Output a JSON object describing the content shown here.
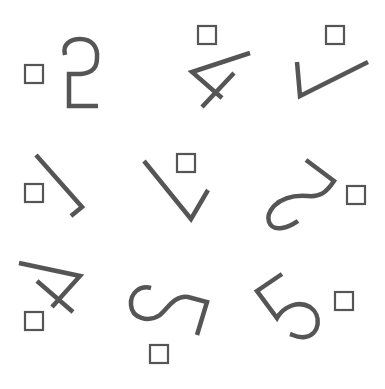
{
  "canvas": {
    "width": 385,
    "height": 389,
    "background": "#ffffff"
  },
  "colors": {
    "stroke": "#555555",
    "box": "#555555"
  },
  "glyphs": [
    {
      "id": "glyph-1",
      "label": "mirrored-2",
      "box": {
        "x": 25,
        "y": 65,
        "size": 18
      },
      "path": "M65 55 C62 43 72 39 80 39 C92 39 98 47 97 58 C97 70 90 75 72 74 L69 74 L69 106 L98 106"
    },
    {
      "id": "glyph-2",
      "label": "rotated-4",
      "box": {
        "x": 198,
        "y": 26,
        "size": 18
      },
      "path": "M250 53 L192 72 L222 98 M234 73 L202 107"
    },
    {
      "id": "glyph-3",
      "label": "rotated-check",
      "box": {
        "x": 326,
        "y": 26,
        "size": 18
      },
      "path": "M297 62 L300 96 L368 62"
    },
    {
      "id": "glyph-4",
      "label": "rotated-1",
      "box": {
        "x": 25,
        "y": 184,
        "size": 18
      },
      "path": "M36 155 L82 207 L71 216"
    },
    {
      "id": "glyph-5",
      "label": "rotated-check",
      "box": {
        "x": 177,
        "y": 154,
        "size": 18
      },
      "path": "M144 161 L191 219 L208 190"
    },
    {
      "id": "glyph-6",
      "label": "rotated-2",
      "box": {
        "x": 347,
        "y": 186,
        "size": 18
      },
      "path": "M306 160 L334 181 C326 193 320 197 308 196 C295 195 282 198 274 206 C264 217 268 230 282 228 C290 227 295 223 298 221"
    },
    {
      "id": "glyph-7",
      "label": "rotated-4",
      "box": {
        "x": 25,
        "y": 312,
        "size": 18
      },
      "path": "M19 263 L80 276 L52 307 M37 281 L73 312"
    },
    {
      "id": "glyph-8",
      "label": "rotated-2",
      "box": {
        "x": 150,
        "y": 345,
        "size": 18
      },
      "path": "M151 288 C140 285 130 293 131 305 C132 318 148 323 160 315 C168 308 175 295 188 297 L207 302 L197 335"
    },
    {
      "id": "glyph-9",
      "label": "rotated-5",
      "box": {
        "x": 335,
        "y": 292,
        "size": 18
      },
      "path": "M282 274 L257 291 L277 318 C283 307 298 300 310 307 C322 315 320 335 305 337 C298 338 293 335 290 334"
    }
  ]
}
